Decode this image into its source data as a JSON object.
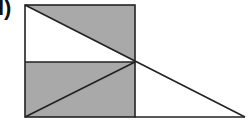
{
  "figure": {
    "label": "l)",
    "colors": {
      "shade": "#a9a9a9",
      "stroke": "#222222",
      "background": "#ffffff"
    }
  }
}
